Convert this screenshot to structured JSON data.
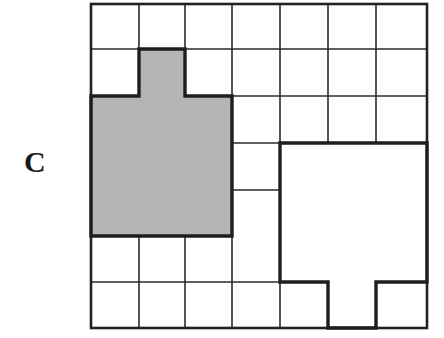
{
  "figure": {
    "label": "C",
    "grid": {
      "columns": 7,
      "rows": 7
    },
    "shapes": [
      {
        "name": "shaded-shape",
        "fill": "#b5b5b5",
        "cells_description": "3x3 block at columns 1-3, rows 3-5 with a one-cell tab above at column 2, row 2"
      },
      {
        "name": "outlined-shape",
        "fill": "#ffffff",
        "cells_description": "3x3 block at columns 5-7, rows 4-6 with a one-cell tab below at column 6, row 7"
      }
    ],
    "colors": {
      "line": "#222222",
      "shade": "#b5b5b5",
      "background": "#ffffff"
    }
  }
}
